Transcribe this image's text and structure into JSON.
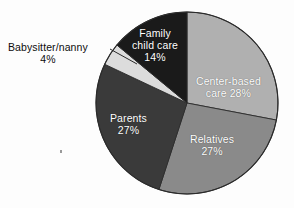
{
  "figure": {
    "background_color": "#fdfdfd",
    "outline_color": "#2b2b2b",
    "center_x": 187,
    "center_y": 103,
    "radius": 91
  },
  "chart_data": {
    "type": "pie",
    "title": "",
    "subtitle": "",
    "xlabel": "",
    "ylabel": "",
    "grid": false,
    "legend_position": "none",
    "label_style": "inside-slice-with-callout",
    "start_angle_deg": 0,
    "direction": "clockwise",
    "units": "percent",
    "total": 100,
    "categories": [
      "Center-based care",
      "Relatives",
      "Parents",
      "Babysitter/nanny",
      "Family child care"
    ],
    "values": [
      28,
      27,
      27,
      4,
      14
    ],
    "colors": [
      "#b0b0b0",
      "#8a8a8a",
      "#3a3a3a",
      "#dcdcdc",
      "#1a1a1a"
    ],
    "slices": [
      {
        "name": "center-based-care",
        "label_line1": "Center-based",
        "label_line2": "care 28%",
        "value": 28,
        "value_text": "28%",
        "color": "#b0b0b0",
        "text_color": "#ffffff",
        "label_placement": "inside",
        "start_deg": 0,
        "end_deg": 100.8
      },
      {
        "name": "relatives",
        "label_line1": "Relatives",
        "label_line2": "27%",
        "value": 27,
        "value_text": "27%",
        "color": "#8a8a8a",
        "text_color": "#ffffff",
        "label_placement": "inside",
        "start_deg": 100.8,
        "end_deg": 198.0
      },
      {
        "name": "parents",
        "label_line1": "Parents",
        "label_line2": "27%",
        "value": 27,
        "value_text": "27%",
        "color": "#3a3a3a",
        "text_color": "#ffffff",
        "label_placement": "inside",
        "start_deg": 198.0,
        "end_deg": 295.2
      },
      {
        "name": "babysitter-nanny",
        "label_line1": "Babysitter/nanny",
        "label_line2": "4%",
        "value": 4,
        "value_text": "4%",
        "color": "#dcdcdc",
        "text_color": "#0d0d0d",
        "label_placement": "outside-callout",
        "start_deg": 295.2,
        "end_deg": 309.6
      },
      {
        "name": "family-child-care",
        "label_line1": "Family",
        "label_line2": "child care",
        "label_line3": "14%",
        "value": 14,
        "value_text": "14%",
        "color": "#1a1a1a",
        "text_color": "#ffffff",
        "label_placement": "inside",
        "start_deg": 309.6,
        "end_deg": 360.0
      }
    ]
  },
  "callout": {
    "name": "babysitter-leader-line",
    "color": "#2b2b2b",
    "from_x": 110,
    "from_y": 49,
    "to_x": 137,
    "to_y": 64
  }
}
